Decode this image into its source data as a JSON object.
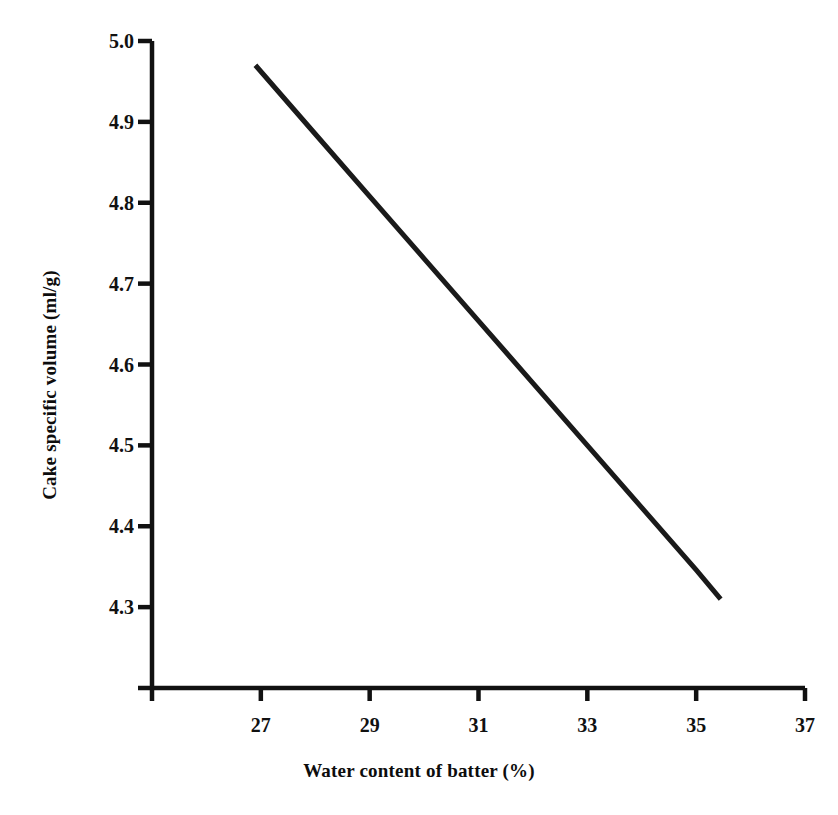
{
  "chart_data": {
    "type": "line",
    "title": "",
    "subtitle": "",
    "xlabel": "Water content of batter (%)",
    "ylabel": "Cake specific volume (ml/g)",
    "xlim": [
      25,
      37
    ],
    "ylim": [
      4.2,
      5.0
    ],
    "grid": false,
    "legend": null,
    "legend_position": "none",
    "x_tick_labels": [
      "27",
      "29",
      "31",
      "33",
      "35",
      "37"
    ],
    "x_tick_values": [
      27,
      29,
      31,
      33,
      35,
      37
    ],
    "y_tick_labels": [
      "4.3",
      "4.4",
      "4.5",
      "4.6",
      "4.7",
      "4.8",
      "4.9",
      "5.0"
    ],
    "y_tick_values": [
      4.3,
      4.4,
      4.5,
      4.6,
      4.7,
      4.8,
      4.9,
      5.0
    ],
    "series": [
      {
        "name": "Cake specific volume",
        "color": "#1a1a1a",
        "line_width": 5,
        "x": [
          26.9,
          35.45
        ],
        "values": [
          4.97,
          4.31
        ],
        "points": [
          {
            "x": 26.9,
            "y": 4.97
          },
          {
            "x": 28.0,
            "y": 4.885
          },
          {
            "x": 29.0,
            "y": 4.808
          },
          {
            "x": 30.0,
            "y": 4.731
          },
          {
            "x": 31.0,
            "y": 4.654
          },
          {
            "x": 32.0,
            "y": 4.577
          },
          {
            "x": 33.0,
            "y": 4.5
          },
          {
            "x": 34.0,
            "y": 4.423
          },
          {
            "x": 35.0,
            "y": 4.346
          },
          {
            "x": 35.45,
            "y": 4.31
          }
        ]
      }
    ],
    "annotations": []
  },
  "axes": {
    "x_title": "Water content of batter (%)",
    "y_title": "Cake specific volume (ml/g)",
    "x_ticks": [
      {
        "label": "27",
        "value": 27
      },
      {
        "label": "29",
        "value": 29
      },
      {
        "label": "31",
        "value": 31
      },
      {
        "label": "33",
        "value": 33
      },
      {
        "label": "35",
        "value": 35
      },
      {
        "label": "37",
        "value": 37
      }
    ],
    "y_ticks": [
      {
        "label": "5.0",
        "value": 5.0
      },
      {
        "label": "4.9",
        "value": 4.9
      },
      {
        "label": "4.8",
        "value": 4.8
      },
      {
        "label": "4.7",
        "value": 4.7
      },
      {
        "label": "4.6",
        "value": 4.6
      },
      {
        "label": "4.5",
        "value": 4.5
      },
      {
        "label": "4.4",
        "value": 4.4
      },
      {
        "label": "4.3",
        "value": 4.3
      }
    ]
  },
  "style": {
    "axis_color": "#111111",
    "line_color": "#1a1a1a",
    "background": "#ffffff"
  }
}
